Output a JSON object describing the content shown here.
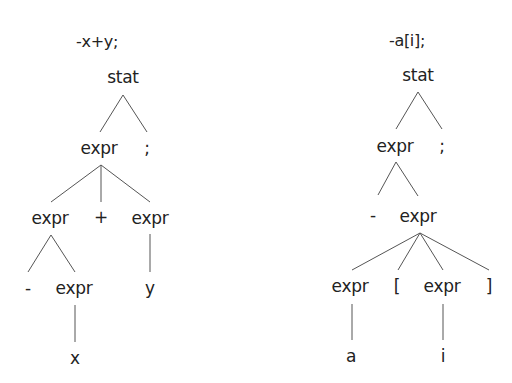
{
  "trees": [
    {
      "title": "-x+y;",
      "nodes": {
        "root": "stat",
        "l1_expr": "expr",
        "l1_semi": ";",
        "l2_expr_left": "expr",
        "l2_plus": "+",
        "l2_expr_right": "expr",
        "l3_minus": "-",
        "l3_expr": "expr",
        "l3_y": "y",
        "l4_x": "x"
      }
    },
    {
      "title": "-a[i];",
      "nodes": {
        "root": "stat",
        "l1_expr": "expr",
        "l1_semi": ";",
        "l2_minus": "-",
        "l2_expr": "expr",
        "l3_expr_left": "expr",
        "l3_lbracket": "[",
        "l3_expr_right": "expr",
        "l3_rbracket": "]",
        "l4_a": "a",
        "l4_i": "i"
      }
    }
  ]
}
